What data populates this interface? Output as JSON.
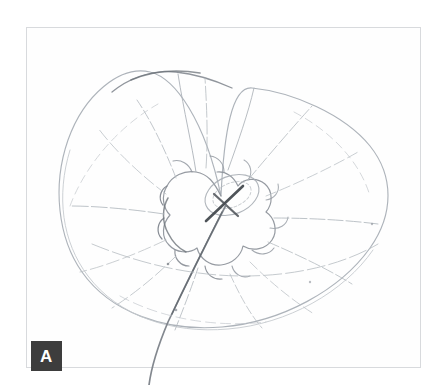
{
  "figure": {
    "panel_letter": "A",
    "background_color": "#ffffff",
    "frame_color": "#d8dadd",
    "ink_color": "#9aa0a6",
    "dark_ink_color": "#5a5f66",
    "label_background_color": "#3d3d3d",
    "label_text_color": "#ffffff"
  },
  "frame": {
    "x": 26,
    "y": 27,
    "width": 395,
    "height": 341
  },
  "panel_label": {
    "letter": "A",
    "x": 31,
    "y": 341,
    "width": 31,
    "height": 30
  },
  "specimen": {
    "outline_bounds": {
      "left": 60,
      "top": 70,
      "right": 390,
      "bottom": 328
    },
    "centre": {
      "x": 221,
      "y": 196
    },
    "whorl_count": 1,
    "radial_line_count": 14
  }
}
